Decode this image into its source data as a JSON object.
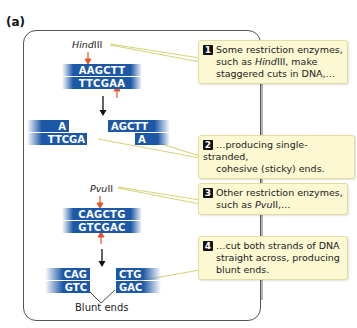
{
  "panel_label": "(a)",
  "colors": {
    "dna_band": "#1d58a6",
    "cut_arrow": "#e8522a",
    "callout_bg": "#fbf8d2",
    "callout_border": "#e3dca0",
    "leader_line": "#d9d37a"
  },
  "hindiii": {
    "enzyme_italic": "Hind",
    "enzyme_roman": "III",
    "top_strand": "AAGCTT",
    "bottom_strand": "TTCGAA",
    "left_fragment": {
      "top": "A",
      "bottom": "TTCGA"
    },
    "right_fragment": {
      "top": "AGCTT",
      "bottom": "A"
    }
  },
  "pvuii": {
    "enzyme_italic": "Pvu",
    "enzyme_roman": "II",
    "top_strand": "CAGCTG",
    "bottom_strand": "GTCGAC",
    "left_fragment": {
      "top": "CAG",
      "bottom": "GTC"
    },
    "right_fragment": {
      "top": "CTG",
      "bottom": "GAC"
    },
    "blunt_label": "Blunt ends"
  },
  "callouts": [
    {
      "number": "1",
      "line1": "Some restriction enzymes,",
      "line2_pre": "such as ",
      "line2_italic": "Hind",
      "line2_post": "III, make",
      "line3": "staggered cuts in DNA,…"
    },
    {
      "number": "2",
      "line1": "…producing single-stranded,",
      "line2": "cohesive (sticky) ends."
    },
    {
      "number": "3",
      "line1": "Other restriction enzymes,",
      "line2_pre": "such as ",
      "line2_italic": "Pvu",
      "line2_post": "II,…"
    },
    {
      "number": "4",
      "line1": "…cut both strands of DNA",
      "line2": "straight across, producing",
      "line3": "blunt ends."
    }
  ]
}
